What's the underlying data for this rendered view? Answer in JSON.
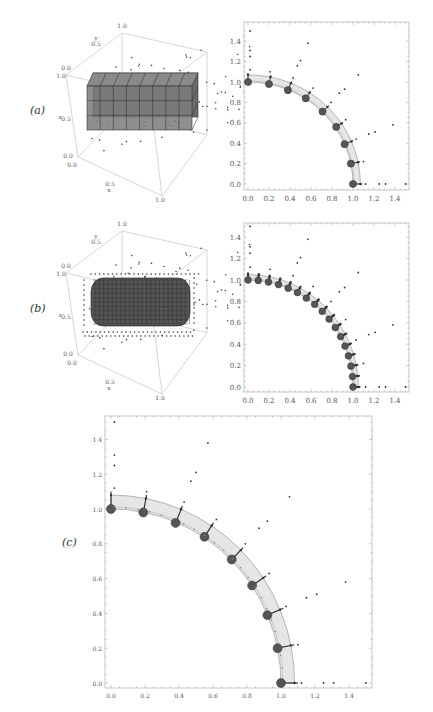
{
  "figure": {
    "panels": [
      {
        "id": "a",
        "label": "(a)"
      },
      {
        "id": "b",
        "label": "(b)"
      },
      {
        "id": "c",
        "label": "(c)"
      }
    ]
  },
  "chart_data": [
    {
      "panel": "a-3d",
      "type": "scatter",
      "title": "",
      "description": "3D view of unit cube with scattered points and coarse voxel block (rectangular cuboid of cells)",
      "axis_labels": {
        "x": "x",
        "y": "y",
        "z": "z"
      },
      "tick_labels": {
        "x": [
          "0.0",
          "0.5",
          "1.0"
        ],
        "y": [
          "0.0",
          "0.5",
          "1.0"
        ],
        "z": [
          "0.0",
          "0.5",
          "1.0"
        ]
      },
      "voxel_grid": {
        "cols": 8,
        "rows": 3,
        "depth": 2
      }
    },
    {
      "panel": "a-2d",
      "type": "scatter",
      "title": "",
      "xlabel": "",
      "ylabel": "",
      "xlim": [
        0,
        1.5
      ],
      "ylim": [
        0,
        1.5
      ],
      "xticks": [
        "0.0",
        "0.2",
        "0.4",
        "0.6",
        "0.8",
        "1.0",
        "1.2",
        "1.4"
      ],
      "yticks": [
        "0.0",
        "0.2",
        "0.4",
        "0.6",
        "0.8",
        "1.0",
        "1.2",
        "1.4"
      ],
      "series": [
        {
          "name": "large markers (circle nodes)",
          "points": [
            [
              0,
              1
            ],
            [
              0.2,
              0.98
            ],
            [
              0.38,
              0.92
            ],
            [
              0.55,
              0.84
            ],
            [
              0.71,
              0.71
            ],
            [
              0.84,
              0.56
            ],
            [
              0.92,
              0.39
            ],
            [
              0.98,
              0.2
            ],
            [
              1,
              0
            ]
          ]
        },
        {
          "name": "small outer points",
          "points": [
            [
              0.02,
              1.5
            ],
            [
              0.02,
              1.31
            ],
            [
              0.02,
              1.25
            ],
            [
              0.02,
              1.12
            ],
            [
              0.57,
              1.38
            ],
            [
              0.47,
              1.16
            ],
            [
              0.5,
              1.21
            ],
            [
              0.21,
              1.1
            ],
            [
              0.43,
              1.04
            ],
            [
              0.62,
              0.94
            ],
            [
              0.79,
              0.8
            ],
            [
              0.87,
              0.89
            ],
            [
              0.92,
              0.93
            ],
            [
              1.05,
              1.07
            ],
            [
              0.93,
              0.63
            ],
            [
              1.03,
              0.44
            ],
            [
              1.1,
              0.22
            ],
            [
              1.15,
              0.49
            ],
            [
              1.21,
              0.51
            ],
            [
              1.38,
              0.58
            ],
            [
              1.12,
              0
            ],
            [
              1.25,
              0
            ],
            [
              1.31,
              0
            ],
            [
              1.5,
              0
            ]
          ]
        }
      ],
      "band": {
        "inner_radius": 1.0,
        "outer_radius": 1.07
      }
    },
    {
      "panel": "b-3d",
      "type": "scatter",
      "description": "3D view of unit cube with scattered points and refined voxel block with rounded ends (capsule shape)",
      "axis_labels": {
        "x": "x",
        "y": "y",
        "z": "z"
      },
      "tick_labels": {
        "x": [
          "0.0",
          "0.5",
          "1.0"
        ],
        "y": [
          "0.0",
          "0.5",
          "1.0"
        ],
        "z": [
          "0.0",
          "0.5",
          "1.0"
        ]
      }
    },
    {
      "panel": "b-2d",
      "type": "scatter",
      "xlim": [
        0,
        1.5
      ],
      "ylim": [
        0,
        1.5
      ],
      "xticks": [
        "0.0",
        "0.2",
        "0.4",
        "0.6",
        "0.8",
        "1.0",
        "1.2",
        "1.4"
      ],
      "yticks": [
        "0.0",
        "0.2",
        "0.4",
        "0.6",
        "0.8",
        "1.0",
        "1.2",
        "1.4"
      ],
      "series": [
        {
          "name": "large markers (17 nodes)",
          "points_angle_deg": [
            90,
            84.4,
            78.75,
            73.1,
            67.5,
            61.9,
            56.25,
            50.6,
            45,
            39.4,
            33.75,
            28.1,
            22.5,
            16.9,
            11.25,
            5.6,
            0
          ],
          "radius": 1.0
        },
        {
          "name": "small outer points",
          "points": [
            [
              0.02,
              1.5
            ],
            [
              0.02,
              1.31
            ],
            [
              0.02,
              1.25
            ],
            [
              0.02,
              1.12
            ],
            [
              0.57,
              1.38
            ],
            [
              0.47,
              1.16
            ],
            [
              0.5,
              1.21
            ],
            [
              0.21,
              1.1
            ],
            [
              0.43,
              1.04
            ],
            [
              0.62,
              0.94
            ],
            [
              0.79,
              0.8
            ],
            [
              0.87,
              0.89
            ],
            [
              0.92,
              0.93
            ],
            [
              1.05,
              1.07
            ],
            [
              0.93,
              0.63
            ],
            [
              1.03,
              0.44
            ],
            [
              1.1,
              0.22
            ],
            [
              1.15,
              0.49
            ],
            [
              1.21,
              0.51
            ],
            [
              1.38,
              0.58
            ],
            [
              1.12,
              0
            ],
            [
              1.25,
              0
            ],
            [
              1.31,
              0
            ],
            [
              1.5,
              0
            ]
          ]
        }
      ],
      "band": {
        "inner_radius": 1.0,
        "outer_radius": 1.05
      }
    },
    {
      "panel": "c",
      "type": "scatter",
      "xlim": [
        0,
        1.5
      ],
      "ylim": [
        0,
        1.5
      ],
      "xticks": [
        "0.0",
        "0.2",
        "0.4",
        "0.6",
        "0.8",
        "1.0",
        "1.2",
        "1.4"
      ],
      "yticks": [
        "0.0",
        "0.2",
        "0.4",
        "0.6",
        "0.8",
        "1.0",
        "1.2",
        "1.4"
      ],
      "series": [
        {
          "name": "large markers (circle nodes)",
          "points": [
            [
              0,
              1
            ],
            [
              0.19,
              0.98
            ],
            [
              0.38,
              0.92
            ],
            [
              0.55,
              0.84
            ],
            [
              0.71,
              0.71
            ],
            [
              0.83,
              0.56
            ],
            [
              0.92,
              0.39
            ],
            [
              0.98,
              0.2
            ],
            [
              1,
              0
            ]
          ]
        },
        {
          "name": "small outer points",
          "points": [
            [
              0.02,
              1.5
            ],
            [
              0.02,
              1.31
            ],
            [
              0.02,
              1.25
            ],
            [
              0.02,
              1.12
            ],
            [
              0.57,
              1.38
            ],
            [
              0.47,
              1.16
            ],
            [
              0.5,
              1.21
            ],
            [
              0.21,
              1.1
            ],
            [
              0.43,
              1.04
            ],
            [
              0.62,
              0.94
            ],
            [
              0.79,
              0.8
            ],
            [
              0.87,
              0.89
            ],
            [
              0.92,
              0.93
            ],
            [
              1.05,
              1.07
            ],
            [
              0.93,
              0.63
            ],
            [
              1.03,
              0.44
            ],
            [
              1.1,
              0.22
            ],
            [
              1.15,
              0.49
            ],
            [
              1.21,
              0.51
            ],
            [
              1.38,
              0.58
            ],
            [
              1.12,
              0
            ],
            [
              1.25,
              0
            ],
            [
              1.31,
              0
            ],
            [
              1.5,
              0
            ]
          ]
        }
      ],
      "band": {
        "inner_radius": 1.0,
        "outer_radius": 1.08
      }
    }
  ]
}
